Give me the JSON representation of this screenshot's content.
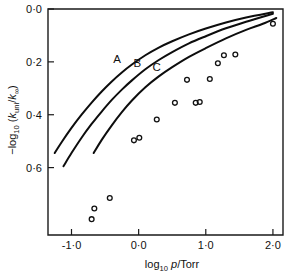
{
  "chart_data": {
    "type": "line",
    "title": "",
    "subtitle": "",
    "xlabel": "log10 p/Torr",
    "ylabel": "-log10 (kuni/k∞)",
    "xlim": [
      -1.35,
      2.15
    ],
    "ylim": [
      0.0,
      0.855
    ],
    "y_inverted": true,
    "grid": false,
    "legend_position": "inline-curve-labels",
    "x_ticks": [
      -1.0,
      0.0,
      1.0,
      2.0
    ],
    "x_tick_labels": [
      "-1·0",
      "0·0",
      "1·0",
      "2·0"
    ],
    "y_ticks": [
      0.0,
      0.2,
      0.4,
      0.6
    ],
    "y_tick_labels": [
      "0·0",
      "0·2",
      "0·4",
      "0·6"
    ],
    "series": [
      {
        "name": "A",
        "label": "A",
        "label_x": -0.32,
        "label_y": 0.205,
        "type": "line",
        "x": [
          -1.25,
          -1.15,
          -1.0,
          -0.85,
          -0.7,
          -0.55,
          -0.4,
          -0.25,
          -0.1,
          0.1,
          0.3,
          0.5,
          0.75,
          1.0,
          1.3,
          1.6,
          2.0
        ],
        "y": [
          0.545,
          0.505,
          0.45,
          0.4,
          0.354,
          0.312,
          0.274,
          0.24,
          0.21,
          0.175,
          0.146,
          0.122,
          0.096,
          0.074,
          0.051,
          0.032,
          0.012
        ]
      },
      {
        "name": "B",
        "label": "B",
        "label_x": -0.02,
        "label_y": 0.218,
        "type": "line",
        "x": [
          -1.12,
          -1.0,
          -0.85,
          -0.7,
          -0.55,
          -0.4,
          -0.25,
          -0.1,
          0.1,
          0.3,
          0.5,
          0.75,
          1.0,
          1.3,
          1.6,
          2.0
        ],
        "y": [
          0.595,
          0.545,
          0.487,
          0.435,
          0.388,
          0.344,
          0.305,
          0.27,
          0.228,
          0.193,
          0.163,
          0.13,
          0.103,
          0.073,
          0.048,
          0.018
        ]
      },
      {
        "name": "C",
        "label": "C",
        "label_x": 0.27,
        "label_y": 0.235,
        "type": "line",
        "x": [
          -0.67,
          -0.55,
          -0.4,
          -0.25,
          -0.1,
          0.1,
          0.3,
          0.5,
          0.75,
          1.0,
          1.3,
          1.6,
          1.85,
          2.05
        ],
        "y": [
          0.545,
          0.495,
          0.44,
          0.39,
          0.346,
          0.296,
          0.255,
          0.22,
          0.181,
          0.148,
          0.111,
          0.079,
          0.056,
          0.034
        ]
      },
      {
        "name": "experimental-points",
        "label": "",
        "type": "scatter",
        "marker": "open-circle",
        "x": [
          -0.7,
          -0.66,
          -0.43,
          -0.07,
          0.01,
          0.27,
          0.54,
          0.72,
          0.85,
          0.91,
          1.06,
          1.18,
          1.27,
          1.44,
          2.0
        ],
        "y": [
          0.795,
          0.755,
          0.715,
          0.497,
          0.487,
          0.418,
          0.355,
          0.268,
          0.355,
          0.352,
          0.265,
          0.205,
          0.175,
          0.172,
          0.056
        ]
      }
    ]
  },
  "axis": {
    "y_title_prefix": "−log",
    "y_title_sub1": "10",
    "y_title_open": " (",
    "y_title_k1": "k",
    "y_title_k1sub": "uni",
    "y_title_slash": "/",
    "y_title_k2": "k",
    "y_title_k2sub": "∞",
    "y_title_close": ")",
    "x_title_prefix": "log",
    "x_title_sub": "10",
    "x_title_var": " p",
    "x_title_unit": "/Torr"
  },
  "colors": {
    "curve": "#0d0d0d",
    "axis": "#1a1a1a",
    "marker": "#111111",
    "background": "#ffffff"
  }
}
